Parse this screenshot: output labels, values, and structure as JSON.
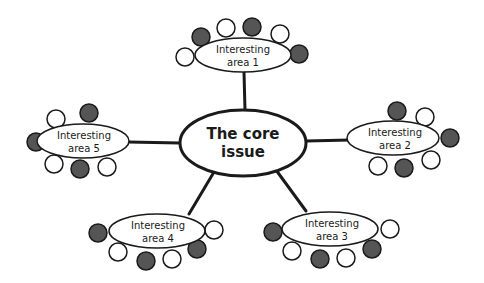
{
  "diagram": {
    "type": "mind-map",
    "colors": {
      "stroke": "#1a1a1a",
      "filled": "#555555",
      "open": "#ffffff",
      "background": "#ffffff"
    },
    "core": {
      "line1": "The core",
      "line2": "issue"
    },
    "areas": [
      {
        "id": 1,
        "line1": "Interesting",
        "line2": "area 1"
      },
      {
        "id": 2,
        "line1": "Interesting",
        "line2": "area 2"
      },
      {
        "id": 3,
        "line1": "Interesting",
        "line2": "area 3"
      },
      {
        "id": 4,
        "line1": "Interesting",
        "line2": "area 4"
      },
      {
        "id": 5,
        "line1": "Interesting",
        "line2": "area 5"
      }
    ]
  }
}
